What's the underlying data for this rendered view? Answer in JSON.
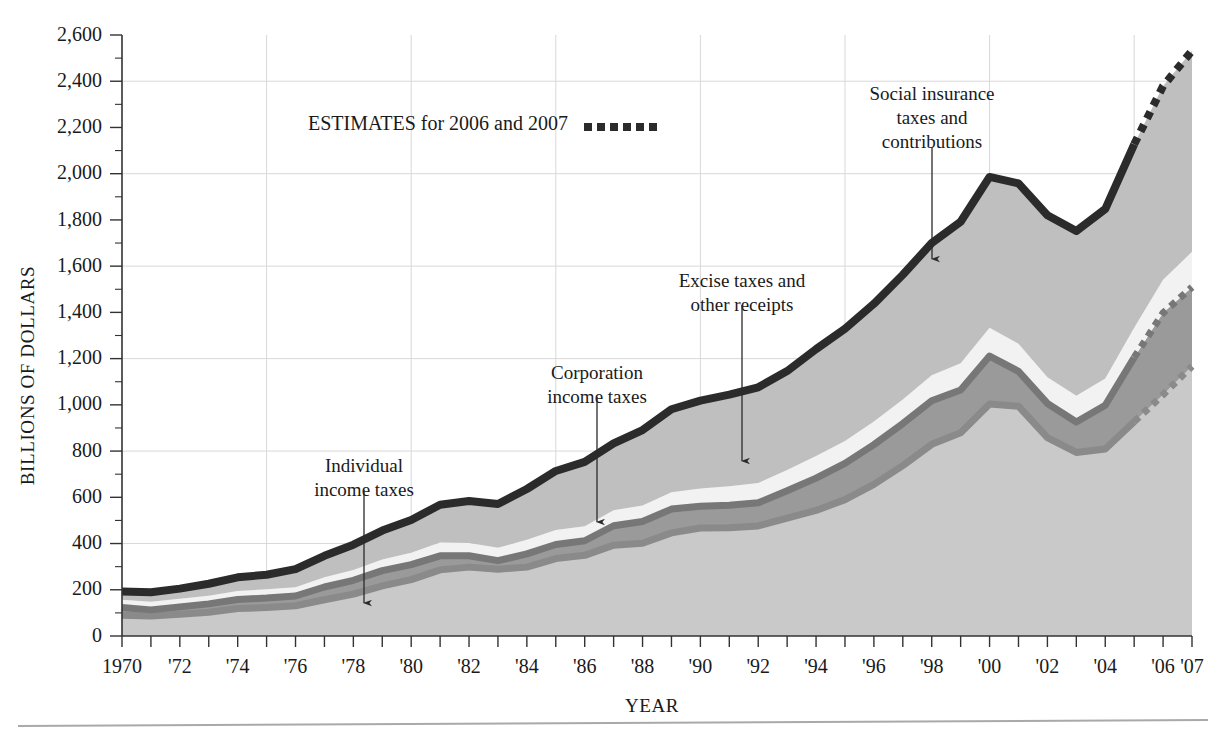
{
  "figure": {
    "background": "#ffffff",
    "plot_left": 122,
    "plot_right": 1192,
    "plot_top": 35,
    "plot_bottom": 636
  },
  "axes": {
    "y_title": "BILLIONS OF DOLLARS",
    "x_title": "YEAR",
    "y_ticks": [
      "0",
      "200",
      "400",
      "600",
      "800",
      "1,000",
      "1,200",
      "1,400",
      "1,600",
      "1,800",
      "2,000",
      "2,200",
      "2,400",
      "2,600"
    ],
    "y_tick_values": [
      0,
      200,
      400,
      600,
      800,
      1000,
      1200,
      1400,
      1600,
      1800,
      2000,
      2200,
      2400,
      2600
    ],
    "y_minor_step": 100,
    "y_gridline_values": [
      400,
      800,
      1200,
      1600,
      2000,
      2400
    ],
    "x_gridline_years": [
      1975,
      1980,
      1985,
      1990,
      1995,
      2000,
      2005
    ],
    "x_tick_labels": [
      {
        "year": 1970,
        "label": "1970"
      },
      {
        "year": 1972,
        "label": "'72"
      },
      {
        "year": 1974,
        "label": "'74"
      },
      {
        "year": 1976,
        "label": "'76"
      },
      {
        "year": 1978,
        "label": "'78"
      },
      {
        "year": 1980,
        "label": "'80"
      },
      {
        "year": 1982,
        "label": "'82"
      },
      {
        "year": 1984,
        "label": "'84"
      },
      {
        "year": 1986,
        "label": "'86"
      },
      {
        "year": 1988,
        "label": "'88"
      },
      {
        "year": 1990,
        "label": "'90"
      },
      {
        "year": 1992,
        "label": "'92"
      },
      {
        "year": 1994,
        "label": "'94"
      },
      {
        "year": 1996,
        "label": "'96"
      },
      {
        "year": 1998,
        "label": "'98"
      },
      {
        "year": 2000,
        "label": "'00"
      },
      {
        "year": 2002,
        "label": "'02"
      },
      {
        "year": 2004,
        "label": "'04"
      },
      {
        "year": 2006,
        "label": "'06"
      },
      {
        "year": 2007,
        "label": "'07"
      }
    ]
  },
  "legend": {
    "estimates_text": "ESTIMATES for 2006 and 2007",
    "swatch_style": "dotted-thick-black",
    "x": 308,
    "y": 124
  },
  "annotations": [
    {
      "name": "individual-income-taxes",
      "lines": [
        "Individual",
        "income taxes"
      ],
      "text_x": 364,
      "text_y": 472,
      "arrow_from_x": 364,
      "arrow_from_y": 490,
      "arrow_to_x": 364,
      "arrow_to_y": 612
    },
    {
      "name": "corporation-income-taxes",
      "lines": [
        "Corporation",
        "income taxes"
      ],
      "text_x": 597,
      "text_y": 379,
      "arrow_from_x": 597,
      "arrow_from_y": 397,
      "arrow_to_x": 597,
      "arrow_to_y": 531
    },
    {
      "name": "excise-taxes-and-other-receipts",
      "lines": [
        "Excise taxes and",
        "other receipts"
      ],
      "text_x": 742,
      "text_y": 287,
      "arrow_from_x": 742,
      "arrow_from_y": 305,
      "arrow_to_x": 742,
      "arrow_to_y": 470
    },
    {
      "name": "social-insurance-taxes-and-contributions",
      "lines": [
        "Social insurance",
        "taxes and",
        "contributions"
      ],
      "text_x": 932,
      "text_y": 100,
      "arrow_from_x": 932,
      "arrow_from_y": 148,
      "arrow_to_x": 932,
      "arrow_to_y": 268
    }
  ],
  "colors": {
    "individual": "#c9c9c9",
    "corporation": "#9a9a9a",
    "excise": "#f2f2f2",
    "social": "#bfbfbf",
    "total_line": "#2b2b2b",
    "corporation_line": "#777777",
    "individual_line": "#8a8a8a",
    "gridline": "#d8d8d8",
    "text": "#1a1a1a"
  },
  "chart_data": {
    "type": "area",
    "title": "",
    "subtitle": "",
    "xlabel": "YEAR",
    "ylabel": "BILLIONS OF DOLLARS",
    "xlim": [
      1970,
      2007
    ],
    "ylim": [
      0,
      2600
    ],
    "grid": true,
    "legend_position": "inline-annotations",
    "stacking": "stacked-from-bottom",
    "estimate_years": [
      2006,
      2007
    ],
    "x": [
      1970,
      1971,
      1972,
      1973,
      1974,
      1975,
      1976,
      1977,
      1978,
      1979,
      1980,
      1981,
      1982,
      1983,
      1984,
      1985,
      1986,
      1987,
      1988,
      1989,
      1990,
      1991,
      1992,
      1993,
      1994,
      1995,
      1996,
      1997,
      1998,
      1999,
      2000,
      2001,
      2002,
      2003,
      2004,
      2005,
      2006,
      2007
    ],
    "series": [
      {
        "name": "Individual income taxes",
        "color": "#c9c9c9",
        "values": [
          90,
          86,
          94,
          103,
          119,
          123,
          131,
          157,
          181,
          217,
          244,
          286,
          298,
          289,
          298,
          335,
          349,
          393,
          401,
          446,
          467,
          468,
          476,
          510,
          543,
          590,
          656,
          737,
          829,
          879,
          1004,
          994,
          858,
          794,
          809,
          927,
          1044,
          1167
        ]
      },
      {
        "name": "Corporation income taxes",
        "color": "#9a9a9a",
        "values": [
          33,
          27,
          32,
          36,
          39,
          41,
          42,
          55,
          60,
          66,
          65,
          61,
          49,
          37,
          57,
          61,
          63,
          84,
          94,
          103,
          94,
          98,
          100,
          118,
          140,
          157,
          172,
          182,
          189,
          185,
          207,
          151,
          148,
          132,
          189,
          278,
          354,
          342
        ]
      },
      {
        "name": "Excise taxes and other receipts",
        "color": "#f2f2f2",
        "values": [
          34,
          35,
          35,
          35,
          37,
          38,
          38,
          42,
          44,
          48,
          51,
          58,
          55,
          56,
          61,
          63,
          63,
          67,
          70,
          73,
          77,
          82,
          86,
          90,
          96,
          97,
          100,
          104,
          110,
          116,
          122,
          119,
          113,
          113,
          116,
          128,
          143,
          153
        ]
      },
      {
        "name": "Social insurance taxes and contributions",
        "color": "#bfbfbf",
        "values": [
          36,
          41,
          44,
          52,
          59,
          63,
          78,
          93,
          110,
          125,
          142,
          163,
          182,
          189,
          220,
          255,
          278,
          289,
          326,
          359,
          380,
          396,
          414,
          428,
          462,
          485,
          509,
          540,
          572,
          612,
          653,
          694,
          701,
          713,
          733,
          794,
          838,
          870
        ]
      }
    ],
    "totals": [
      193,
      189,
      205,
      226,
      254,
      265,
      289,
      347,
      395,
      456,
      502,
      568,
      584,
      571,
      636,
      714,
      753,
      833,
      891,
      981,
      1018,
      1044,
      1076,
      1146,
      1241,
      1329,
      1437,
      1563,
      1700,
      1792,
      1986,
      1958,
      1820,
      1752,
      1847,
      2127,
      2379,
      2532
    ]
  }
}
